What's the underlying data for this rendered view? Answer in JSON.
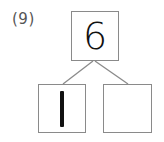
{
  "problem": {
    "number_label": "(9)",
    "whole": "6",
    "part_left": "1",
    "part_right": ""
  },
  "colors": {
    "border": "#8a8a8a",
    "text": "#111111",
    "label": "#555555"
  }
}
